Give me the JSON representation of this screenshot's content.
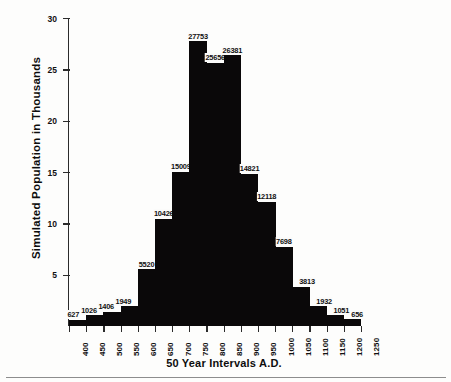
{
  "chart_data": {
    "type": "bar",
    "title": "",
    "xlabel": "50 Year Intervals A.D.",
    "ylabel": "Simulated Population in Thousands",
    "categories": [
      "400",
      "450",
      "500",
      "550",
      "600",
      "650",
      "700",
      "750",
      "800",
      "850",
      "900",
      "950",
      "1000",
      "1050",
      "1100",
      "1150",
      "1200",
      "1250"
    ],
    "values": [
      627,
      1026,
      1406,
      1949,
      5520,
      10426,
      15009,
      27753,
      25656,
      26381,
      14821,
      12118,
      7698,
      3813,
      1932,
      1051,
      656,
      0
    ],
    "value_labels": [
      "627",
      "1026",
      "1406",
      "1949",
      "5520",
      "10426",
      "15009",
      "27753",
      "25656",
      "26381",
      "14821",
      "12118",
      "7698",
      "3813",
      "1932",
      "1051",
      "656",
      ""
    ],
    "bar_heights_thousands": [
      0.627,
      1.026,
      1.406,
      1.949,
      5.52,
      10.426,
      15.009,
      27.753,
      25.656,
      26.381,
      14.821,
      12.118,
      7.698,
      3.813,
      1.932,
      1.051,
      0.656,
      0.0
    ],
    "yticks": [
      5,
      10,
      15,
      20,
      25,
      30
    ],
    "ytick_labels": [
      "5",
      "10",
      "15",
      "20",
      "25",
      "30"
    ],
    "ylim": [
      0,
      30
    ],
    "grid": false,
    "legend": null,
    "bar_color": "#0a0809",
    "axis_color": "#2b2b2b",
    "units": "thousands"
  }
}
